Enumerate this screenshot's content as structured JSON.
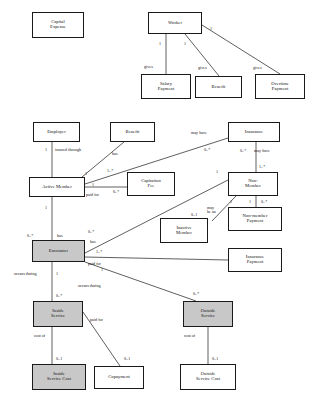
{
  "diagram": {
    "fill_shaded": "#c8c8c8",
    "fill_plain": "#ffffff",
    "stroke": "#1a1a1a",
    "nodes": [
      {
        "id": "capital_expense",
        "label": "Capital\nExpense",
        "shaded": false,
        "x": 32,
        "y": 12,
        "w": 52,
        "h": 26
      },
      {
        "id": "worker",
        "label": "Worker",
        "shaded": false,
        "x": 148,
        "y": 12,
        "w": 54,
        "h": 22
      },
      {
        "id": "salary_payment",
        "label": "Salary\nPayment",
        "shaded": false,
        "x": 141,
        "y": 74,
        "w": 50,
        "h": 25
      },
      {
        "id": "benefit_top",
        "label": "Benefit",
        "shaded": false,
        "x": 195,
        "y": 76,
        "w": 47,
        "h": 22
      },
      {
        "id": "overtime_payment",
        "label": "Overtime\nPayment",
        "shaded": false,
        "x": 255,
        "y": 74,
        "w": 50,
        "h": 25
      },
      {
        "id": "employer",
        "label": "Employer",
        "shaded": false,
        "x": 33,
        "y": 122,
        "w": 47,
        "h": 20
      },
      {
        "id": "benefit_mid",
        "label": "Benefit",
        "shaded": false,
        "x": 110,
        "y": 122,
        "w": 45,
        "h": 20
      },
      {
        "id": "insurance",
        "label": "Insurance",
        "shaded": false,
        "x": 228,
        "y": 122,
        "w": 52,
        "h": 20
      },
      {
        "id": "active_member",
        "label": "Active Member",
        "shaded": false,
        "x": 29,
        "y": 177,
        "w": 56,
        "h": 20
      },
      {
        "id": "capitation_fee",
        "label": "Capitation\nFee",
        "shaded": false,
        "x": 127,
        "y": 172,
        "w": 48,
        "h": 24
      },
      {
        "id": "non_member",
        "label": "Non-\nMember",
        "shaded": false,
        "x": 228,
        "y": 172,
        "w": 50,
        "h": 24
      },
      {
        "id": "inactive_member",
        "label": "Inactive\nMember",
        "shaded": false,
        "x": 160,
        "y": 218,
        "w": 48,
        "h": 25
      },
      {
        "id": "non_member_payment",
        "label": "Non-member\nPayment",
        "shaded": false,
        "x": 228,
        "y": 207,
        "w": 54,
        "h": 24
      },
      {
        "id": "insurance_payment",
        "label": "Insurance\nPayment",
        "shaded": false,
        "x": 228,
        "y": 248,
        "w": 54,
        "h": 24
      },
      {
        "id": "encounter",
        "label": "Encounter",
        "shaded": true,
        "x": 32,
        "y": 240,
        "w": 53,
        "h": 22
      },
      {
        "id": "inside_service",
        "label": "Inside\nService",
        "shaded": true,
        "x": 33,
        "y": 301,
        "w": 50,
        "h": 26
      },
      {
        "id": "outside_service",
        "label": "Outside\nService",
        "shaded": true,
        "x": 183,
        "y": 301,
        "w": 50,
        "h": 26
      },
      {
        "id": "inside_service_cost",
        "label": "Inside\nService Cost",
        "shaded": true,
        "x": 32,
        "y": 364,
        "w": 54,
        "h": 26
      },
      {
        "id": "copayment",
        "label": "Copayment",
        "shaded": false,
        "x": 94,
        "y": 366,
        "w": 50,
        "h": 23
      },
      {
        "id": "outside_service_cost",
        "label": "Outside\nService Cost",
        "shaded": false,
        "x": 180,
        "y": 364,
        "w": 56,
        "h": 26
      }
    ],
    "edges": [
      {
        "id": "worker-salary",
        "points": "166,34 166,74"
      },
      {
        "id": "worker-benefit",
        "points": "185,34 219,76"
      },
      {
        "id": "worker-overtime",
        "points": "202,25 280,74"
      },
      {
        "id": "employer-active",
        "points": "52,142 52,177"
      },
      {
        "id": "benefit-active",
        "points": "124,142 82,177"
      },
      {
        "id": "insurance-active",
        "points": "228,138 85,184"
      },
      {
        "id": "insurance-nonmember",
        "points": "256,142 256,172"
      },
      {
        "id": "active-capitation",
        "points": "85,187 127,187"
      },
      {
        "id": "active-encounter",
        "points": "52,197 52,240"
      },
      {
        "id": "nonmember-encounter",
        "points": "228,180 85,253"
      },
      {
        "id": "nonmember-inactive",
        "points": "236,196 212,221"
      },
      {
        "id": "nonmember-nmpayment",
        "points": "256,196 256,207"
      },
      {
        "id": "encounter-insideservice",
        "points": "52,262 52,301"
      },
      {
        "id": "encounter-outsideservice",
        "points": "85,262 196,301"
      },
      {
        "id": "encounter-inspayment",
        "points": "85,257 228,260"
      },
      {
        "id": "inside-insidecost",
        "points": "52,327 52,364"
      },
      {
        "id": "inside-copayment",
        "points": "83,312 120,366"
      },
      {
        "id": "outside-outsidecost",
        "points": "208,327 208,364"
      }
    ],
    "labels": [
      {
        "id": "m-worker-salary-1",
        "text": "1",
        "x": 159,
        "y": 42
      },
      {
        "id": "m-worker-benefit-1",
        "text": "1",
        "x": 184,
        "y": 42
      },
      {
        "id": "m-worker-overtime-1",
        "text": "1",
        "x": 210,
        "y": 27
      },
      {
        "id": "r-gives-salary",
        "text": "gives",
        "x": 144,
        "y": 65
      },
      {
        "id": "r-gives-benefit",
        "text": "gives",
        "x": 198,
        "y": 66
      },
      {
        "id": "r-gives-overtime",
        "text": "gives",
        "x": 253,
        "y": 66
      },
      {
        "id": "m-employer-1",
        "text": "1",
        "x": 45,
        "y": 148
      },
      {
        "id": "r-insured-through",
        "text": "insured through",
        "x": 55,
        "y": 148
      },
      {
        "id": "r-has-benefit-mid",
        "text": "has",
        "x": 112,
        "y": 152
      },
      {
        "id": "r-may-have-ins",
        "text": "may have",
        "x": 191,
        "y": 131
      },
      {
        "id": "m-may-have-ins-0n",
        "text": "0..*",
        "x": 204,
        "y": 148
      },
      {
        "id": "m-ins-nonmember-0n",
        "text": "0..*",
        "x": 240,
        "y": 149
      },
      {
        "id": "r-may-have-nonmember",
        "text": "may have",
        "x": 254,
        "y": 149
      },
      {
        "id": "m-ins-nonmember-1n",
        "text": "1..*",
        "x": 259,
        "y": 165
      },
      {
        "id": "m-active-benefit-1",
        "text": "1",
        "x": 85,
        "y": 172
      },
      {
        "id": "m-active-ins-1n",
        "text": "1..*",
        "x": 107,
        "y": 169
      },
      {
        "id": "m-active-capfee-1",
        "text": "1",
        "x": 92,
        "y": 183
      },
      {
        "id": "r-paid-for-capfee",
        "text": "paid for",
        "x": 86,
        "y": 193
      },
      {
        "id": "m-capfee-0n",
        "text": "0..*",
        "x": 113,
        "y": 190
      },
      {
        "id": "m-nonmember-enc-1",
        "text": "1",
        "x": 216,
        "y": 170
      },
      {
        "id": "m-nonmember-inactive-1",
        "text": "1",
        "x": 230,
        "y": 200
      },
      {
        "id": "m-nonmember-nmp-1",
        "text": "1",
        "x": 249,
        "y": 200
      },
      {
        "id": "m-nmp-0n",
        "text": "0..*",
        "x": 261,
        "y": 200
      },
      {
        "id": "m-inactive-01",
        "text": "0..1",
        "x": 191,
        "y": 213
      },
      {
        "id": "r-may-be-an",
        "text": "may\nbe an",
        "x": 207,
        "y": 206
      },
      {
        "id": "m-active-enc-1",
        "text": "1",
        "x": 45,
        "y": 206
      },
      {
        "id": "m-enc-has-0n",
        "text": "0..*",
        "x": 27,
        "y": 234
      },
      {
        "id": "r-has-encounter",
        "text": "has",
        "x": 57,
        "y": 234
      },
      {
        "id": "m-enc-nonmember-0n",
        "text": "0..*",
        "x": 88,
        "y": 230
      },
      {
        "id": "r-has-nonmember",
        "text": "has",
        "x": 90,
        "y": 240
      },
      {
        "id": "m-enc-inspay-1n",
        "text": "1..*",
        "x": 96,
        "y": 250
      },
      {
        "id": "r-paid-for-encounter",
        "text": "paid for",
        "x": 88,
        "y": 262
      },
      {
        "id": "m-enc-paidfor-1",
        "text": "1",
        "x": 101,
        "y": 268
      },
      {
        "id": "r-occurs-during-left",
        "text": "occurs during",
        "x": 14,
        "y": 272
      },
      {
        "id": "m-enc-inside-1",
        "text": "1",
        "x": 56,
        "y": 272
      },
      {
        "id": "r-occurs-during-right",
        "text": "occurs during",
        "x": 78,
        "y": 284
      },
      {
        "id": "m-inside-0n",
        "text": "0..*",
        "x": 56,
        "y": 294
      },
      {
        "id": "m-outside-0n",
        "text": "0..*",
        "x": 193,
        "y": 292
      },
      {
        "id": "r-cost-of-inside",
        "text": "cost of",
        "x": 34,
        "y": 334
      },
      {
        "id": "r-paid-for-copay",
        "text": "paid for",
        "x": 90,
        "y": 318
      },
      {
        "id": "r-cost-of-outside",
        "text": "cost of",
        "x": 184,
        "y": 334
      },
      {
        "id": "m-insidecost-01",
        "text": "0..1",
        "x": 56,
        "y": 357
      },
      {
        "id": "m-copay-01",
        "text": "0..1",
        "x": 124,
        "y": 357
      },
      {
        "id": "m-outsidecost-01",
        "text": "0..1",
        "x": 212,
        "y": 357
      }
    ]
  }
}
